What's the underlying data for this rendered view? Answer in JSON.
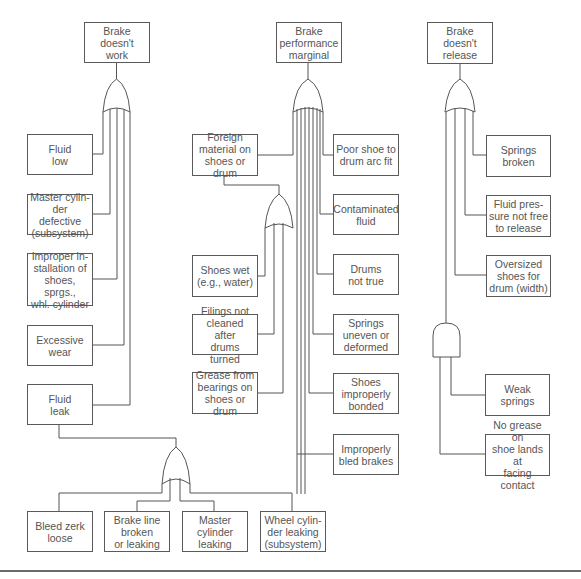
{
  "diagram": {
    "type": "fault-tree",
    "colors": {
      "line": "#555555",
      "box_border": "#5a5a5a",
      "text": "#555555",
      "background": "#ffffff"
    },
    "trees": [
      {
        "top_event": "Brake\ndoesn't\nwork",
        "gate": "OR",
        "events": [
          "Fluid\nlow",
          "Master cylin-\nder defective\n(subsystem)",
          "Improper in-\nstallation of\nshoes, sprgs.,\nwhl. cylinder",
          "Excessive\nwear",
          "Fluid\nleak"
        ],
        "sub_tree": {
          "parent": "Fluid\nleak",
          "gate": "OR",
          "events": [
            "Bleed zerk\nloose",
            "Brake line\nbroken\nor leaking",
            "Master\ncylinder\nleaking",
            "Wheel cylin-\nder leaking\n(subsystem)"
          ]
        }
      },
      {
        "top_event": "Brake\nperformance\nmarginal",
        "gate": "OR",
        "events": [
          "Foreign\nmaterial on\nshoes or drum",
          "Poor shoe to\ndrum arc fit",
          "Contaminated\nfluid",
          "Drums\nnot true",
          "Springs\nuneven or\ndeformed",
          "Shoes\nimproperly\nbonded",
          "Improperly\nbled brakes"
        ],
        "sub_tree": {
          "parent": "Foreign\nmaterial on\nshoes or drum",
          "gate": "OR",
          "events": [
            "Shoes wet\n(e.g., water)",
            "Filings not\ncleaned after\ndrums turned",
            "Grease from\nbearings on\nshoes or drum"
          ]
        }
      },
      {
        "top_event": "Brake\ndoesn't\nrelease",
        "gate": "OR",
        "events": [
          "Springs\nbroken",
          "Fluid pres-\nsure not free\nto release",
          "Oversized\nshoes for\ndrum (width)"
        ],
        "sub_tree": {
          "gate": "AND",
          "events": [
            "Weak\nsprings",
            "No grease on\nshoe lands at\nfacing contact"
          ]
        }
      }
    ]
  }
}
